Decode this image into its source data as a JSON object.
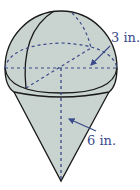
{
  "figure": {
    "labels": {
      "radius": "3 in.",
      "height": "6 in."
    },
    "colors": {
      "fill": "#c9d3cf",
      "outline": "#1a1a1a",
      "dashed": "#3a4a8a",
      "label": "#3a4a8a"
    }
  }
}
